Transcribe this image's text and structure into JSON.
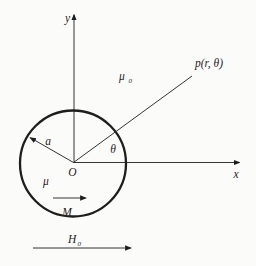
{
  "diagram": {
    "axis_labels": {
      "x": "x",
      "y": "y"
    },
    "origin_label": "O",
    "radius_label": "a",
    "angle_label": "θ",
    "field_point_label": "p(r, θ)",
    "inner_permeability_label": "μ",
    "outer_permeability": {
      "base": "μ",
      "sub": "0"
    },
    "magnetization_label": "M",
    "applied_field": {
      "base": "H",
      "sub": "0"
    }
  },
  "colors": {
    "ink": "#1e1e1e",
    "background": "#fbfbfa"
  }
}
